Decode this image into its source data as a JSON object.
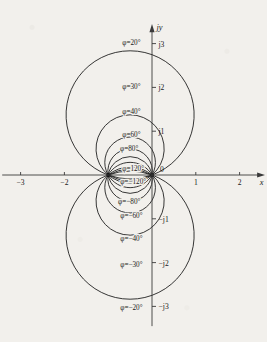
{
  "figure": {
    "title": "",
    "axes": {
      "x_label": "x",
      "y_label": "jy",
      "origin_label": "0",
      "x_ticks": [
        {
          "value": -3,
          "label": "−3"
        },
        {
          "value": -2,
          "label": "−2"
        },
        {
          "value": 1,
          "label": "1"
        },
        {
          "value": 2,
          "label": "2"
        }
      ],
      "y_ticks": [
        {
          "value": 3,
          "label": "j3"
        },
        {
          "value": 2,
          "label": "j2"
        },
        {
          "value": 1,
          "label": "j1"
        },
        {
          "value": -1,
          "label": "−j1"
        },
        {
          "value": -2,
          "label": "−j2"
        },
        {
          "value": -3,
          "label": "−j3"
        }
      ],
      "x_range": [
        -3.5,
        2.6
      ],
      "y_range": [
        -3.5,
        3.5
      ],
      "grid": false
    },
    "singular_points": [
      {
        "label": "",
        "x": -1,
        "y": 0
      },
      {
        "label": "",
        "x": 0,
        "y": 0
      }
    ]
  },
  "chart_data": {
    "type": "line",
    "xlabel": "x",
    "ylabel": "jy",
    "xlim": [
      -3.5,
      2.6
    ],
    "ylim": [
      -3.5,
      3.5
    ],
    "grid": false,
    "legend": "none",
    "series": [
      {
        "name": "φ=20°",
        "phi_deg": 20,
        "half": "upper",
        "label": "φ=20°",
        "label_x": -0.47,
        "label_y": 3.02,
        "apex_y": 2.84
      },
      {
        "name": "φ=30°",
        "phi_deg": 30,
        "half": "upper",
        "label": "φ=30°",
        "label_x": -0.47,
        "label_y": 2.03,
        "apex_y": 1.87
      },
      {
        "name": "φ=40°",
        "phi_deg": 40,
        "half": "upper",
        "label": "φ=40°",
        "label_x": -0.47,
        "label_y": 1.45,
        "apex_y": 1.37
      },
      {
        "name": "φ=60°",
        "phi_deg": 60,
        "half": "upper",
        "label": "φ=60°",
        "label_x": -0.47,
        "label_y": 0.93,
        "apex_y": 0.79
      },
      {
        "name": "φ=80°",
        "phi_deg": 80,
        "half": "upper",
        "label": "φ=80°",
        "label_x": -0.52,
        "label_y": 0.61,
        "apex_y": 0.5
      },
      {
        "name": "φ=120°",
        "phi_deg": 120,
        "half": "upper",
        "label": "φ=120°",
        "label_x": -0.43,
        "label_y": 0.14,
        "apex_y": 0.14
      },
      {
        "name": "φ=−120°",
        "phi_deg": -120,
        "half": "lower",
        "label": "φ=−120°",
        "label_x": -0.43,
        "label_y": -0.14,
        "apex_y": -0.14
      },
      {
        "name": "φ=−80°",
        "phi_deg": -80,
        "half": "lower",
        "label": "φ=−80°",
        "label_x": -0.52,
        "label_y": -0.61,
        "apex_y": -0.5
      },
      {
        "name": "φ=−60°",
        "phi_deg": -60,
        "half": "lower",
        "label": "φ=−60°",
        "label_x": -0.47,
        "label_y": -0.93,
        "apex_y": -0.79
      },
      {
        "name": "φ=−40°",
        "phi_deg": -40,
        "half": "lower",
        "label": "φ=−40°",
        "label_x": -0.47,
        "label_y": -1.45,
        "apex_y": -1.37
      },
      {
        "name": "φ=−30°",
        "phi_deg": -30,
        "half": "lower",
        "label": "φ=−30°",
        "label_x": -0.47,
        "label_y": -2.03,
        "apex_y": -1.87
      },
      {
        "name": "φ=−20°",
        "phi_deg": -20,
        "half": "lower",
        "label": "φ=−20°",
        "label_x": -0.47,
        "label_y": -3.02,
        "apex_y": -2.84
      }
    ],
    "extra_arcs_phi_deg": [
      100,
      140,
      160,
      -100,
      -140,
      -160
    ],
    "through_points": [
      [
        -1,
        0
      ],
      [
        0,
        0
      ]
    ]
  }
}
